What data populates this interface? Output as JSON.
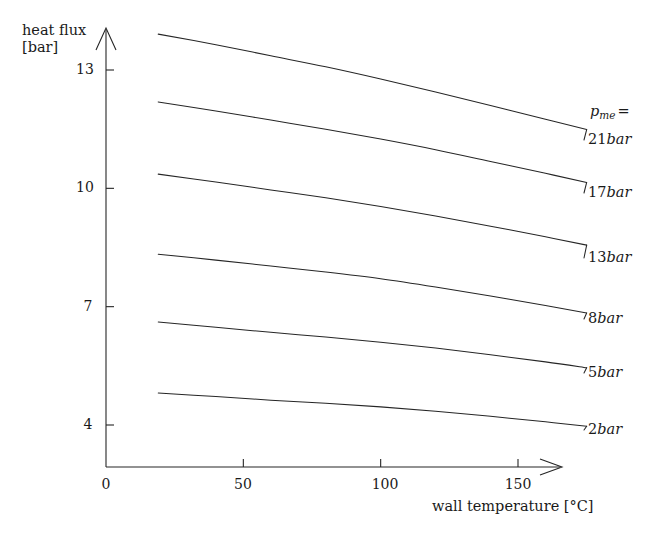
{
  "chart_data": {
    "type": "line",
    "title": "",
    "xlabel": "wall temperature [°C]",
    "ylabel_line1": "heat flux",
    "ylabel_line2": "[bar]",
    "xlim": [
      0,
      180
    ],
    "ylim": [
      2.9,
      14.3
    ],
    "xticks": [
      0,
      50,
      100,
      150
    ],
    "xtick_labels": [
      "0",
      "50",
      "100",
      "150"
    ],
    "yticks": [
      4,
      7,
      10,
      13
    ],
    "ytick_labels": [
      "4",
      "7",
      "10",
      "13"
    ],
    "grid": false,
    "legend_position": "right-inline",
    "series_variable": "p",
    "series_variable_subscript": "me",
    "series_variable_equals": "=",
    "x": [
      19,
      40,
      60,
      80,
      100,
      120,
      140,
      160,
      175
    ],
    "series": [
      {
        "name": "21bar",
        "label_number": "21",
        "label_unit": "bar",
        "values": [
          13.91,
          13.64,
          13.36,
          13.08,
          12.77,
          12.44,
          12.1,
          11.75,
          11.49
        ]
      },
      {
        "name": "17bar",
        "label_number": "17",
        "label_unit": "bar",
        "values": [
          12.19,
          11.96,
          11.73,
          11.5,
          11.25,
          10.98,
          10.68,
          10.38,
          10.15
        ]
      },
      {
        "name": "13bar",
        "label_number": "13",
        "label_unit": "bar",
        "values": [
          10.36,
          10.16,
          9.96,
          9.76,
          9.54,
          9.3,
          9.04,
          8.77,
          8.56
        ]
      },
      {
        "name": "8bar",
        "label_number": "8",
        "label_unit": "bar",
        "values": [
          8.33,
          8.18,
          8.03,
          7.88,
          7.71,
          7.5,
          7.27,
          7.03,
          6.84
        ]
      },
      {
        "name": "5bar",
        "label_number": "5",
        "label_unit": "bar",
        "values": [
          6.61,
          6.48,
          6.35,
          6.23,
          6.1,
          5.95,
          5.78,
          5.6,
          5.45
        ]
      },
      {
        "name": "2bar",
        "label_number": "2",
        "label_unit": "bar",
        "values": [
          4.81,
          4.72,
          4.63,
          4.55,
          4.46,
          4.35,
          4.22,
          4.08,
          3.97
        ]
      }
    ]
  },
  "axes": {
    "y_title_line1": "heat flux",
    "y_title_line2": "[bar]",
    "x_title": "wall temperature [°C]",
    "x_tick_0": "0",
    "x_tick_1": "50",
    "x_tick_2": "100",
    "x_tick_3": "150",
    "y_tick_0": "4",
    "y_tick_1": "7",
    "y_tick_2": "10",
    "y_tick_3": "13"
  },
  "legend": {
    "variable": "p",
    "subscript": "me",
    "equals": "=",
    "items": [
      {
        "number": "21",
        "unit": "bar"
      },
      {
        "number": "17",
        "unit": "bar"
      },
      {
        "number": "13",
        "unit": "bar"
      },
      {
        "number": "8",
        "unit": "bar"
      },
      {
        "number": "5",
        "unit": "bar"
      },
      {
        "number": "2",
        "unit": "bar"
      }
    ]
  },
  "colors": {
    "line": "#262626",
    "axis": "#262626",
    "background": "#ffffff",
    "text": "#1a1a1a"
  }
}
